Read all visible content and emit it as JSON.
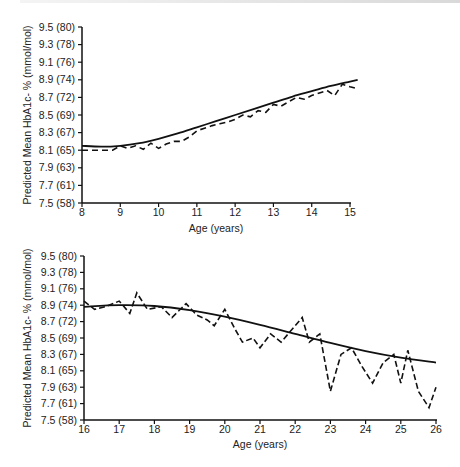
{
  "chart_data": [
    {
      "type": "line",
      "title": "",
      "xlabel": "Age (years)",
      "ylabel": "Predicted Mean HbA1c- % (mmol/mol)",
      "xlim": [
        8,
        15.2
      ],
      "ylim": [
        7.5,
        9.5
      ],
      "x_ticks": [
        "8",
        "9",
        "10",
        "11",
        "12",
        "13",
        "14",
        "15"
      ],
      "y_ticks": [
        "7.5 (58)",
        "7.7 (61)",
        "7.9 (63)",
        "8.1 (65)",
        "8.3 (67)",
        "8.5 (69)",
        "8.7 (72)",
        "8.9 (74)",
        "9.1 (76)",
        "9.3 (78)",
        "9.5 (80)"
      ],
      "grid": false,
      "legend": null,
      "series": [
        {
          "name": "Fitted (solid)",
          "style": "solid",
          "x": [
            8,
            8.5,
            9,
            9.5,
            10,
            10.5,
            11,
            11.5,
            12,
            12.5,
            13,
            13.5,
            14,
            14.5,
            15,
            15.2
          ],
          "values": [
            8.15,
            8.14,
            8.15,
            8.18,
            8.23,
            8.29,
            8.36,
            8.43,
            8.5,
            8.57,
            8.64,
            8.71,
            8.77,
            8.83,
            8.88,
            8.9
          ]
        },
        {
          "name": "Observed (dashed)",
          "style": "dashed",
          "x": [
            8,
            8.5,
            8.8,
            9,
            9.2,
            9.4,
            9.6,
            9.8,
            10,
            10.2,
            10.4,
            10.6,
            10.8,
            11,
            11.2,
            11.4,
            11.6,
            11.8,
            12,
            12.2,
            12.4,
            12.6,
            12.8,
            13,
            13.2,
            13.4,
            13.6,
            13.8,
            14,
            14.2,
            14.4,
            14.6,
            14.8,
            15,
            15.2
          ],
          "values": [
            8.1,
            8.1,
            8.1,
            8.15,
            8.12,
            8.15,
            8.11,
            8.18,
            8.12,
            8.17,
            8.2,
            8.2,
            8.25,
            8.32,
            8.35,
            8.38,
            8.4,
            8.42,
            8.45,
            8.5,
            8.48,
            8.55,
            8.53,
            8.62,
            8.6,
            8.65,
            8.7,
            8.68,
            8.72,
            8.75,
            8.78,
            8.72,
            8.85,
            8.82,
            8.8
          ]
        }
      ]
    },
    {
      "type": "line",
      "title": "",
      "xlabel": "Age (years)",
      "ylabel": "Predicted Mean HbA1c- % (mmol/mol)",
      "xlim": [
        16,
        26
      ],
      "ylim": [
        7.5,
        9.5
      ],
      "x_ticks": [
        "16",
        "17",
        "18",
        "19",
        "20",
        "21",
        "22",
        "23",
        "24",
        "25",
        "26"
      ],
      "y_ticks": [
        "7.5 (58)",
        "7.7 (61)",
        "7.9 (63)",
        "8.1 (65)",
        "8.3 (67)",
        "8.5 (69)",
        "8.7 (72)",
        "8.9 (74)",
        "9.1 (76)",
        "9.3 (78)",
        "9.5 (80)"
      ],
      "grid": false,
      "legend": null,
      "series": [
        {
          "name": "Fitted (solid)",
          "style": "solid",
          "x": [
            16,
            17,
            18,
            19,
            20,
            21,
            22,
            23,
            24,
            25,
            26
          ],
          "values": [
            8.88,
            8.9,
            8.89,
            8.84,
            8.76,
            8.66,
            8.55,
            8.44,
            8.34,
            8.26,
            8.2
          ]
        },
        {
          "name": "Observed (dashed)",
          "style": "dashed",
          "x": [
            16,
            16.3,
            16.6,
            17,
            17.3,
            17.5,
            17.8,
            18.2,
            18.5,
            18.9,
            19.2,
            19.5,
            19.7,
            20,
            20.3,
            20.5,
            20.8,
            21,
            21.3,
            21.6,
            21.9,
            22.2,
            22.4,
            22.7,
            23,
            23.3,
            23.6,
            23.9,
            24.2,
            24.5,
            24.8,
            25,
            25.2,
            25.5,
            25.8,
            26
          ],
          "values": [
            8.95,
            8.85,
            8.88,
            8.95,
            8.8,
            9.05,
            8.85,
            8.88,
            8.75,
            8.92,
            8.78,
            8.72,
            8.65,
            8.85,
            8.6,
            8.45,
            8.5,
            8.38,
            8.55,
            8.45,
            8.6,
            8.75,
            8.45,
            8.55,
            7.85,
            8.3,
            8.38,
            8.15,
            7.95,
            8.2,
            8.3,
            7.95,
            8.35,
            7.85,
            7.65,
            7.9
          ]
        }
      ]
    }
  ],
  "charts": {
    "top": {
      "xlabel": "Age (years)",
      "ylabel": "Predicted Mean HbA1c- % (mmol/mol)",
      "yticks": [
        "9.5 (80)",
        "9.3 (78)",
        "9.1 (76)",
        "8.9 (74)",
        "8.7 (72)",
        "8.5 (69)",
        "8.3 (67)",
        "8.1 (65)",
        "7.9 (63)",
        "7.7 (61)",
        "7.5 (58)"
      ],
      "xticks": [
        "8",
        "9",
        "10",
        "11",
        "12",
        "13",
        "14",
        "15"
      ]
    },
    "bottom": {
      "xlabel": "Age (years)",
      "ylabel": "Predicted Mean HbA1c- % (mmol/mol)",
      "yticks": [
        "9.5 (80)",
        "9.3 (78)",
        "9.1 (76)",
        "8.9 (74)",
        "8.7 (72)",
        "8.5 (69)",
        "8.3 (67)",
        "8.1 (65)",
        "7.9 (63)",
        "7.7 (61)",
        "7.5 (58)"
      ],
      "xticks": [
        "16",
        "17",
        "18",
        "19",
        "20",
        "21",
        "22",
        "23",
        "24",
        "25",
        "26"
      ]
    }
  }
}
